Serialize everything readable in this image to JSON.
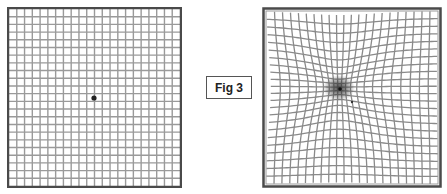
{
  "figure": {
    "label": "Fig 3",
    "normal_grid": {
      "description": "Amsler grid - normal vision",
      "cols": 22,
      "rows": 23,
      "line_color": "#9a9a9a",
      "border_color": "#4a4a4a",
      "center_dot_color": "#222222"
    },
    "distorted_grid": {
      "description": "Amsler grid - distorted vision (metamorphopsia)",
      "cols": 22,
      "rows": 23,
      "line_color": "#8a8a8a",
      "border_color": "#4a4a4a",
      "distortion_center": [
        77,
        81
      ],
      "distortion_strength": 0.55,
      "distortion_radius": 55,
      "blur_spot_color": "#333333"
    }
  }
}
